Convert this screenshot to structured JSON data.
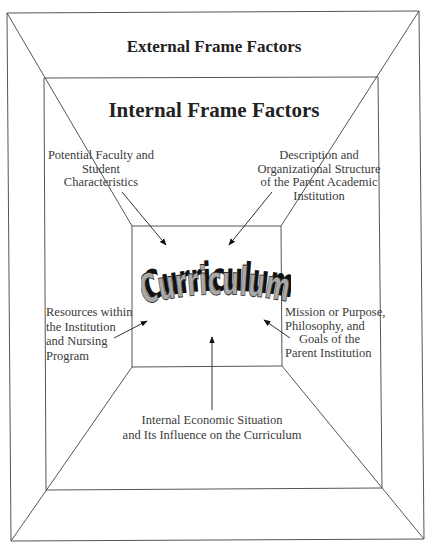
{
  "diagram": {
    "outer_frame": {
      "title": "External Frame Factors"
    },
    "middle_frame": {
      "title": "Internal Frame Factors"
    },
    "center": {
      "label": "Curriculum",
      "fill_color": "#a9a9a9",
      "shadow_color": "#111111"
    },
    "factors": [
      {
        "id": "faculty-student",
        "lines": [
          "Potential Faculty and",
          "Student",
          "Characteristics"
        ]
      },
      {
        "id": "org-structure",
        "lines": [
          "Description and",
          "Organizational Structure",
          "of the Parent Academic",
          "Institution"
        ]
      },
      {
        "id": "resources",
        "lines": [
          "Resources within",
          "the Institution",
          "and Nursing",
          "Program"
        ]
      },
      {
        "id": "mission",
        "lines": [
          "Mission or Purpose,",
          "Philosophy, and",
          "Goals of the",
          "Parent Institution"
        ]
      },
      {
        "id": "economic",
        "lines": [
          "Internal Economic Situation",
          "and Its Influence on the Curriculum"
        ]
      }
    ],
    "colors": {
      "line": "#555555",
      "text": "#3a3a3a",
      "background": "#ffffff"
    }
  }
}
